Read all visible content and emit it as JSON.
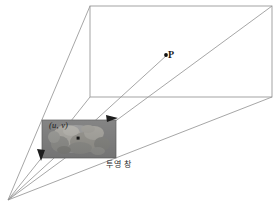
{
  "figure": {
    "type": "perspective-projection-diagram",
    "background_color": "#ffffff",
    "line_color": "#8a8a8a",
    "text_color": "#1a1a1a",
    "image_plane_fill": "#8e8e8e",
    "width": 280,
    "height": 209
  },
  "labels": {
    "scene_point": "P",
    "image_point": "(u, v)",
    "projection_window": "투영 창"
  },
  "geometry": {
    "camera_center": {
      "x": 8,
      "y": 200
    },
    "far_plane": {
      "top_left": {
        "x": 90,
        "y": 6
      },
      "top_right": {
        "x": 272,
        "y": 6
      },
      "bottom_right": {
        "x": 272,
        "y": 97
      },
      "bottom_left": {
        "x": 90,
        "y": 97
      }
    },
    "image_plane": {
      "top_left": {
        "x": 42,
        "y": 120
      },
      "top_right": {
        "x": 116,
        "y": 120
      },
      "bottom_right": {
        "x": 116,
        "y": 158
      },
      "bottom_left": {
        "x": 42,
        "y": 158
      }
    },
    "scene_point_dot": {
      "x": 166,
      "y": 55
    },
    "image_point_dot": {
      "x": 78,
      "y": 138
    }
  },
  "rays": [
    {
      "name": "ray-to-far-top-left",
      "from": "camera_center",
      "to": {
        "x": 90,
        "y": 6
      }
    },
    {
      "name": "ray-to-far-bottom-left",
      "from": "camera_center",
      "to": {
        "x": 90,
        "y": 97
      }
    },
    {
      "name": "ray-to-far-bottom-right",
      "from": "camera_center",
      "to": {
        "x": 272,
        "y": 97
      }
    },
    {
      "name": "ray-to-scene-point",
      "from": "camera_center",
      "to": {
        "x": 166,
        "y": 55
      }
    },
    {
      "name": "ray-diagonal-to-far-top-right",
      "from": "camera_center",
      "to": {
        "x": 272,
        "y": 6
      }
    }
  ],
  "axes": [
    {
      "name": "u-axis-arrow",
      "direction": "right",
      "tip": {
        "x": 118,
        "y": 118
      }
    },
    {
      "name": "v-axis-arrow",
      "direction": "down",
      "tip": {
        "x": 42,
        "y": 160
      }
    }
  ]
}
